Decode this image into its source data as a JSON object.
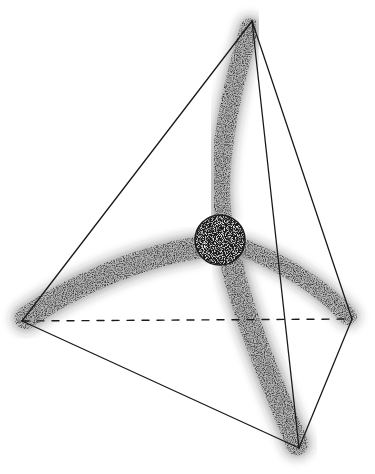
{
  "figure": {
    "type": "tetrahedron-with-central-sphere",
    "canvas": {
      "width": 375,
      "height": 474,
      "background": "#ffffff"
    },
    "colors": {
      "edge": "#1a1a1a",
      "stipple": "#2a2a2a",
      "sphere": "#1c1c1c",
      "sphere_highlight": "#6a6a6a"
    },
    "vertices": {
      "top": [
        252,
        21
      ],
      "left": [
        22,
        321
      ],
      "right": [
        352,
        319
      ],
      "bottom": [
        299,
        448
      ]
    },
    "edges": [
      {
        "name": "edge-top-left",
        "from": "top",
        "to": "left",
        "style": "solid"
      },
      {
        "name": "edge-top-right",
        "from": "top",
        "to": "right",
        "style": "solid"
      },
      {
        "name": "edge-top-bottom",
        "from": "top",
        "to": "bottom",
        "style": "solid"
      },
      {
        "name": "edge-left-bottom",
        "from": "left",
        "to": "bottom",
        "style": "solid"
      },
      {
        "name": "edge-right-bottom",
        "from": "right",
        "to": "bottom",
        "style": "solid"
      },
      {
        "name": "edge-left-right-hidden",
        "from": "left",
        "to": "right",
        "style": "dashed",
        "dash": [
          7,
          8
        ]
      }
    ],
    "sphere": {
      "cx": 220,
      "cy": 240,
      "r": 25
    },
    "lobes": [
      {
        "name": "lobe-top",
        "toward": "top",
        "path": "M 222 216 C 215 170, 230 90, 250 28",
        "width": 26
      },
      {
        "name": "lobe-left",
        "toward": "left",
        "path": "M 196 248 C 150 255, 80 280, 26 318",
        "width": 30
      },
      {
        "name": "lobe-right",
        "toward": "right",
        "path": "M 244 248 C 280 262, 320 285, 348 316",
        "width": 24
      },
      {
        "name": "lobe-bottom",
        "toward": "bottom",
        "path": "M 232 266 C 245 320, 275 390, 297 444",
        "width": 30
      }
    ]
  }
}
